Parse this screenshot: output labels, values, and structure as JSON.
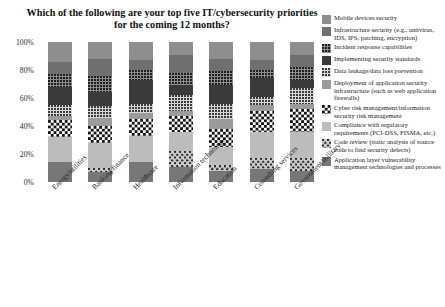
{
  "chart_data": {
    "type": "bar",
    "stacked": true,
    "stack_mode": "percent",
    "title": "Which of the following are your top five IT/cybersecurity priorities for the coming 12 months?",
    "xlabel": "",
    "ylabel": "",
    "ylim": [
      0,
      100
    ],
    "ytick_labels": [
      "0%",
      "20%",
      "40%",
      "60%",
      "80%",
      "100%"
    ],
    "ytick_values": [
      0,
      20,
      40,
      60,
      80,
      100
    ],
    "grid": false,
    "legend_position": "right",
    "categories": [
      "Energy/utilities",
      "Banking/finance",
      "Healthcare",
      "Information technology",
      "Education",
      "Consulting services",
      "Government/military"
    ],
    "series": [
      {
        "name": "Mobile devices security",
        "fill": "f0",
        "values": [
          14,
          12,
          13,
          9,
          12,
          13,
          9
        ]
      },
      {
        "name": "Infrastructure security (e.g., antivirus, IDS, IPS, patching, encryption)",
        "fill": "f1",
        "values": [
          9,
          12,
          7,
          13,
          9,
          7,
          9
        ]
      },
      {
        "name": "Incident response capabilities",
        "fill": "f2",
        "values": [
          9,
          12,
          7,
          9,
          10,
          6,
          9
        ]
      },
      {
        "name": "Implementing security standards",
        "fill": "f3",
        "values": [
          13,
          10,
          17,
          7,
          13,
          13,
          6
        ]
      },
      {
        "name": "Data leakage/data loss prevention",
        "fill": "f4",
        "values": [
          8,
          8,
          7,
          11,
          11,
          6,
          11
        ]
      },
      {
        "name": "Deployment of application security infrastructure (such as web application firewalls)",
        "fill": "f5",
        "values": [
          3,
          6,
          4,
          4,
          7,
          4,
          4
        ]
      },
      {
        "name": "Cyber risk management/information security risk management",
        "fill": "f6",
        "values": [
          12,
          12,
          12,
          11,
          13,
          15,
          16
        ]
      },
      {
        "name": "Compliance with regulatory requirements (PCI-DSS, FISMA, etc.)",
        "fill": "f7",
        "values": [
          18,
          18,
          19,
          14,
          13,
          19,
          19
        ]
      },
      {
        "name": "Code review (static analysis of source code to find security defects)",
        "fill": "f8",
        "values": [
          0,
          3,
          0,
          11,
          4,
          8,
          9
        ]
      },
      {
        "name": "Application layer vulnerability management technologies and processes",
        "fill": "f9",
        "values": [
          14,
          7,
          14,
          11,
          8,
          9,
          8
        ]
      }
    ]
  }
}
